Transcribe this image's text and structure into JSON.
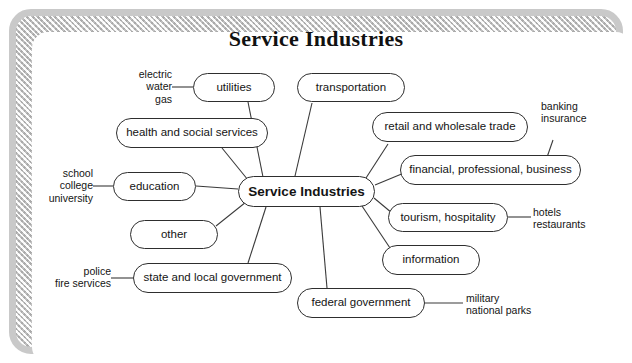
{
  "title": "Service Industries",
  "center": {
    "label": "Service Industries"
  },
  "nodes": [
    {
      "id": "utilities",
      "label": "utilities"
    },
    {
      "id": "transportation",
      "label": "transportation"
    },
    {
      "id": "health",
      "label": "health and social services"
    },
    {
      "id": "retail",
      "label": "retail and wholesale trade"
    },
    {
      "id": "financial",
      "label": "financial, professional, business"
    },
    {
      "id": "education",
      "label": "education"
    },
    {
      "id": "tourism",
      "label": "tourism, hospitality"
    },
    {
      "id": "other",
      "label": "other"
    },
    {
      "id": "information",
      "label": "information"
    },
    {
      "id": "state-local",
      "label": "state and local government"
    },
    {
      "id": "federal",
      "label": "federal government"
    }
  ],
  "examples": {
    "utilities": {
      "lines": [
        "electric",
        "water",
        "gas"
      ]
    },
    "education": {
      "lines": [
        "school",
        "college",
        "university"
      ]
    },
    "state_local": {
      "lines": [
        "police",
        "fire services"
      ]
    },
    "financial": {
      "lines": [
        "banking",
        "insurance"
      ]
    },
    "tourism": {
      "lines": [
        "hotels",
        "restaurants"
      ]
    },
    "federal": {
      "lines": [
        "military",
        "national parks"
      ]
    }
  },
  "colors": {
    "node_border": "#2e2e2e",
    "connector": "#3a3a3a",
    "frame": "#c9c9c9",
    "text": "#141414",
    "background": "#ffffff"
  }
}
